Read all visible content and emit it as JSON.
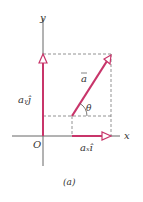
{
  "figure": {
    "caption": "(a)",
    "axes": {
      "x_label": "x",
      "y_label": "y",
      "origin_label": "O"
    },
    "vector": {
      "label": "a",
      "angle_label": "θ"
    },
    "components": {
      "x": "aₓî",
      "y": "aᵧĵ"
    },
    "colors": {
      "vector": "#c8356a",
      "axis": "#555555",
      "dash": "#777777"
    }
  }
}
